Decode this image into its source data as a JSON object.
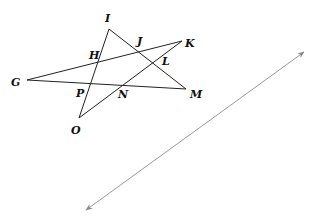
{
  "diagram": {
    "points": {
      "I": {
        "label": "I",
        "x": 109,
        "y": 29,
        "lx": 105,
        "ly": 22
      },
      "G": {
        "label": "G",
        "x": 27,
        "y": 80,
        "lx": 11,
        "ly": 86
      },
      "K": {
        "label": "K",
        "x": 182,
        "y": 41,
        "lx": 185,
        "ly": 47
      },
      "M": {
        "label": "M",
        "x": 186,
        "y": 89,
        "lx": 190,
        "ly": 98
      },
      "O": {
        "label": "O",
        "x": 79,
        "y": 118,
        "lx": 71,
        "ly": 134
      },
      "H": {
        "label": "H",
        "lx": 89,
        "ly": 59
      },
      "J": {
        "label": "J",
        "lx": 137,
        "ly": 45
      },
      "L": {
        "label": "L",
        "lx": 162,
        "ly": 65
      },
      "P": {
        "label": "P",
        "lx": 76,
        "ly": 97
      },
      "N": {
        "label": "N",
        "lx": 118,
        "ly": 98
      }
    },
    "segments": [
      {
        "name": "IO",
        "x1": 109,
        "y1": 29,
        "x2": 79,
        "y2": 118
      },
      {
        "name": "IM",
        "x1": 109,
        "y1": 29,
        "x2": 186,
        "y2": 89
      },
      {
        "name": "GK",
        "x1": 27,
        "y1": 80,
        "x2": 182,
        "y2": 41
      },
      {
        "name": "GM",
        "x1": 27,
        "y1": 80,
        "x2": 186,
        "y2": 89
      },
      {
        "name": "OK",
        "x1": 79,
        "y1": 118,
        "x2": 182,
        "y2": 41
      }
    ],
    "line": {
      "x1": 86,
      "y1": 210,
      "x2": 304,
      "y2": 52
    }
  }
}
